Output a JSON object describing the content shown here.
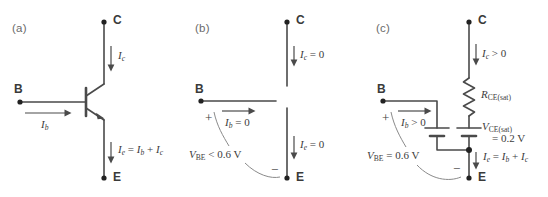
{
  "figure": {
    "background": "#ffffff",
    "line_color": "#4a4a4a",
    "text_color": "#3c3c3c",
    "label_color": "#6a6a6a"
  },
  "panels": [
    {
      "id": "a",
      "label": "(a)",
      "caption_mode": "active-npn-transistor",
      "terminals": [
        {
          "name": "collector",
          "text": "C"
        },
        {
          "name": "base",
          "text": "B"
        },
        {
          "name": "emitter",
          "text": "E"
        }
      ],
      "annotations": [
        {
          "name": "collector-current",
          "text": "I_c"
        },
        {
          "name": "base-current",
          "text": "I_b"
        },
        {
          "name": "emitter-current",
          "text": "I_e = I_b + I_c"
        }
      ]
    },
    {
      "id": "b",
      "label": "(b)",
      "caption_mode": "cutoff-open-circuit",
      "terminals": [
        {
          "name": "collector",
          "text": "C"
        },
        {
          "name": "base",
          "text": "B"
        },
        {
          "name": "emitter",
          "text": "E"
        }
      ],
      "annotations": [
        {
          "name": "collector-current",
          "text": "I_c = 0"
        },
        {
          "name": "base-current",
          "text": "I_b = 0"
        },
        {
          "name": "emitter-current",
          "text": "I_e = 0"
        },
        {
          "name": "base-emitter-voltage",
          "text": "V_BE < 0.6 V"
        },
        {
          "name": "polarity-plus",
          "text": "+"
        },
        {
          "name": "polarity-minus",
          "text": "−"
        }
      ]
    },
    {
      "id": "c",
      "label": "(c)",
      "caption_mode": "saturation-model",
      "terminals": [
        {
          "name": "collector",
          "text": "C"
        },
        {
          "name": "base",
          "text": "B"
        },
        {
          "name": "emitter",
          "text": "E"
        }
      ],
      "components": [
        {
          "name": "saturation-resistor",
          "text": "R_CE(sat)"
        },
        {
          "name": "ce-saturation-battery",
          "text": "V_CE(sat) = 0.2 V"
        },
        {
          "name": "be-battery",
          "text": "V_BE = 0.6 V"
        }
      ],
      "annotations": [
        {
          "name": "collector-current",
          "text": "I_c > 0"
        },
        {
          "name": "base-current",
          "text": "I_b > 0"
        },
        {
          "name": "emitter-current",
          "text": "I_e = I_b + I_c"
        },
        {
          "name": "polarity-plus",
          "text": "+"
        },
        {
          "name": "polarity-minus",
          "text": "−"
        }
      ]
    }
  ],
  "text": {
    "panel_a_label": "(a)",
    "panel_b_label": "(b)",
    "panel_c_label": "(c)",
    "terminal_c": "C",
    "terminal_b": "B",
    "terminal_e": "E",
    "plus": "+",
    "minus": "−"
  }
}
